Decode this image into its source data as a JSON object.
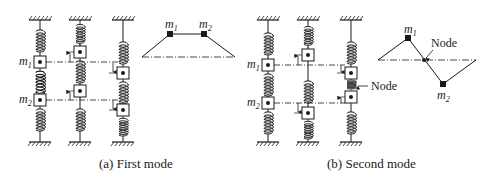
{
  "figure": {
    "colors": {
      "ink": "#1a1a1a",
      "background": "#ffffff"
    },
    "panels": [
      {
        "id": "first-mode",
        "caption": "(a) First mode",
        "mass_labels": {
          "m1": "m",
          "m1_sub": "1",
          "m2": "m",
          "m2_sub": "2"
        },
        "columns": [
          {
            "x": 40,
            "m1_y": 62,
            "m2_y": 100,
            "role": "equilibrium"
          },
          {
            "x": 80,
            "m1_y": 52,
            "m2_y": 91,
            "role": "displaced-up"
          },
          {
            "x": 123,
            "m1_y": 73,
            "m2_y": 110,
            "role": "displaced-down"
          }
        ],
        "mode_shape": {
          "baseline": {
            "x1": 142,
            "x2": 235,
            "y": 57
          },
          "points": [
            {
              "label": "m",
              "sub": "1",
              "x": 170,
              "y": 34
            },
            {
              "label": "m",
              "sub": "2",
              "x": 204,
              "y": 34
            }
          ]
        }
      },
      {
        "id": "second-mode",
        "caption": "(b) Second mode",
        "mass_labels": {
          "m1": "m",
          "m1_sub": "1",
          "m2": "m",
          "m2_sub": "2"
        },
        "node_label": "Node",
        "columns": [
          {
            "x": 268,
            "m1_y": 65,
            "m2_y": 103,
            "role": "equilibrium"
          },
          {
            "x": 308,
            "m1_y": 55,
            "m2_y": 113,
            "role": "opposite-displacement"
          },
          {
            "x": 351,
            "m1_y": 73,
            "m2_y": 97,
            "role": "opposite-displacement"
          }
        ],
        "mode_shape": {
          "node_label": "Node",
          "baseline": {
            "x1": 378,
            "x2": 476,
            "y": 60
          },
          "points": [
            {
              "label": "m",
              "sub": "1",
              "x": 408,
              "y": 38
            },
            {
              "label": "node",
              "x": 424,
              "y": 60
            },
            {
              "label": "m",
              "sub": "2",
              "x": 443,
              "y": 84
            }
          ]
        }
      }
    ]
  }
}
